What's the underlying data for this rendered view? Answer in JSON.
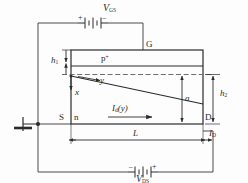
{
  "diagram": {
    "type": "circuit-cross-section",
    "colors": {
      "line": "#2b2b2b",
      "wire": "#4a4a4a",
      "dashed": "#6f6f6f",
      "background": "#fdfdfd"
    }
  },
  "labels": {
    "vgs": "V",
    "vgs_sub": "GS",
    "vgs_plus": "+",
    "vgs_minus": "−",
    "vds": "V",
    "vds_sub": "DS",
    "vds_minus": "−",
    "vds_plus": "+",
    "gate": "G",
    "source": "S",
    "drain": "D",
    "pplus": "p",
    "pplus_sup": "+",
    "nregion": "n",
    "h1": "h",
    "h1_sub": "1",
    "h2": "h",
    "h2_sub": "2",
    "a": "a",
    "x": "x",
    "y": "y",
    "channel_current": "I",
    "channel_current_sub": "d",
    "channel_current_arg": "(y)",
    "length": "L",
    "drain_current": "I",
    "drain_current_sub": "D"
  }
}
